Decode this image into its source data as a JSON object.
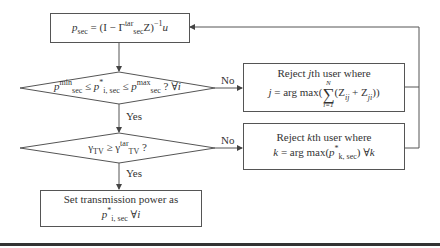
{
  "diagram": {
    "type": "flowchart",
    "nodes": {
      "compute": {
        "kind": "process",
        "text_lhs": "p",
        "text_lhs_sub": "sec",
        "text_rhs": "= (I − Γ",
        "text_rhs_sup": "tar",
        "text_rhs_sub": "sec",
        "text_rhs_tail": "Z)",
        "text_rhs_exp": "−1",
        "text_rhs_vec": "u"
      },
      "check_power": {
        "kind": "decision",
        "p_min": "p",
        "p_min_sup": "min",
        "p_min_sub": "sec",
        "leq1": " ≤ ",
        "p_i": "p",
        "p_i_sup": "*",
        "p_i_sub": "i, sec",
        "leq2": " ≤ ",
        "p_max": "p",
        "p_max_sup": "max",
        "p_max_sub": "sec",
        "tail": " ?   ∀",
        "tail_var": "i"
      },
      "check_sinr": {
        "kind": "decision",
        "gamma": "γ",
        "gamma_sub": "TV",
        "geq": " ≥ ",
        "gamma_tar": "γ",
        "gamma_tar_sup": "tar",
        "gamma_tar_sub": "TV",
        "tail": "  ?"
      },
      "reject_j": {
        "kind": "process",
        "line1_pre": "Reject ",
        "line1_var": "j",
        "line1_post": "th user where",
        "line2_var": "j",
        "line2_eq": " = arg max(",
        "sum_top": "N",
        "sum_sym": "∑",
        "sum_bottom": "i=1",
        "line2_term": "(Z",
        "z1_sub": "ij",
        "plus": " + Z",
        "z2_sub": "ji",
        "close": "))"
      },
      "reject_k": {
        "kind": "process",
        "line1_pre": "Reject ",
        "line1_var": "k",
        "line1_post": "th user where",
        "line2_var": "k",
        "line2_eq": " = arg max(",
        "p": "p",
        "p_sup": "*",
        "p_sub": "k, sec",
        "close": ")   ∀",
        "forall_var": "k"
      },
      "set_power": {
        "kind": "terminal",
        "line1": "Set transmission power as",
        "p": "p",
        "p_sup": "*",
        "p_sub": "i, sec",
        "forall": "   ∀",
        "forall_var": "i"
      }
    },
    "edge_labels": {
      "power_no": "No",
      "power_yes": "Yes",
      "sinr_no": "No",
      "sinr_yes": "Yes"
    },
    "colors": {
      "stroke": "#555555",
      "text": "#333333",
      "rule": "#333333"
    }
  }
}
